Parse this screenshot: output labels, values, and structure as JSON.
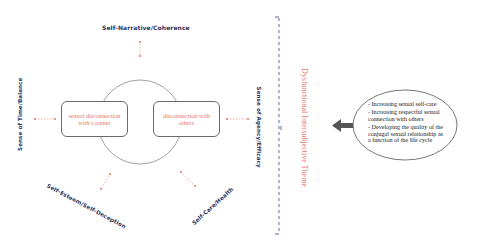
{
  "dimensions": {
    "top": "Self-Narrative/Coherence",
    "left": "Sense of Time/Balance",
    "right": "Sense of Agency/Efficacy",
    "bottom_left": "Self-Esteem/Self-Deception",
    "bottom_right": "Self-Care/Health"
  },
  "boxes": {
    "left": "sexual disconnection with a patner",
    "right": "disconnection with others"
  },
  "theme_label": "Dysfunctional Intersubjective Theme",
  "goals": [
    "- Increasing sexual self-care",
    "- Increasing respectful sexual connection with others",
    "- Developing the quality of the conjugal sexual relationship as a function of the life cycle"
  ],
  "colors": {
    "label_navy": "#2a3560",
    "accent_salmon": "#e8786a",
    "bracket_blue": "#4a5aa0",
    "arrow_gray": "#555555",
    "outline_gray": "#6b6b6b"
  }
}
